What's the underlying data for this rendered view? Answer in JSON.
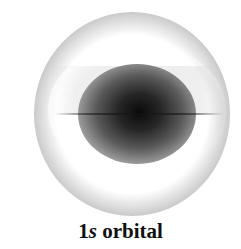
{
  "diagram": {
    "label_prefix": "1",
    "label_italic": "s",
    "label_suffix": " orbital",
    "colors": {
      "background": "#ffffff",
      "core": "#0a0a0a",
      "shell": "#a0a0a0",
      "text": "#111111"
    }
  }
}
